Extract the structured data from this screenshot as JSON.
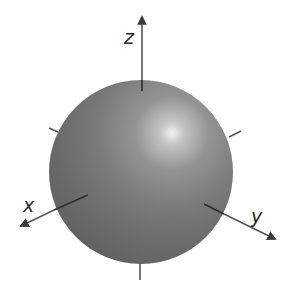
{
  "diagram": {
    "type": "3d-coordinate-sphere",
    "canvas": {
      "width": 292,
      "height": 295,
      "background": "#ffffff"
    },
    "sphere": {
      "cx": 141,
      "cy": 172,
      "r": 92,
      "base_color": "#6e6e6e",
      "edge_color": "#5a5a5a",
      "highlight_color": "#f2f2f2",
      "highlight": {
        "cx": 172,
        "cy": 133
      }
    },
    "axes": [
      {
        "name": "z",
        "label": "z",
        "outer": {
          "x1": 142,
          "y1": 80,
          "x2": 142,
          "y2": 17
        },
        "inner": {
          "x1": 142,
          "y1": 80,
          "x2": 142,
          "y2": 91
        },
        "opposite": {
          "x1": 140,
          "y1": 263,
          "x2": 140,
          "y2": 280
        },
        "label_pos": {
          "x": 124,
          "y": 44
        }
      },
      {
        "name": "x",
        "label": "x",
        "outer": {
          "x1": 54,
          "y1": 210,
          "x2": 21,
          "y2": 226
        },
        "inner": {
          "x1": 88,
          "y1": 195,
          "x2": 54,
          "y2": 210
        },
        "opposite": {
          "x1": 49,
          "y1": 128,
          "x2": 58,
          "y2": 132
        },
        "label_pos": {
          "x": 23,
          "y": 212
        }
      },
      {
        "name": "y",
        "label": "y",
        "outer": {
          "x1": 224,
          "y1": 214,
          "x2": 275,
          "y2": 239
        },
        "inner": {
          "x1": 204,
          "y1": 204,
          "x2": 224,
          "y2": 214
        },
        "opposite": {
          "x1": 229,
          "y1": 137,
          "x2": 241,
          "y2": 131
        },
        "label_pos": {
          "x": 251,
          "y": 223
        }
      }
    ],
    "axis_color": "#555555",
    "inner_axis_color": "#2e2e2e"
  }
}
